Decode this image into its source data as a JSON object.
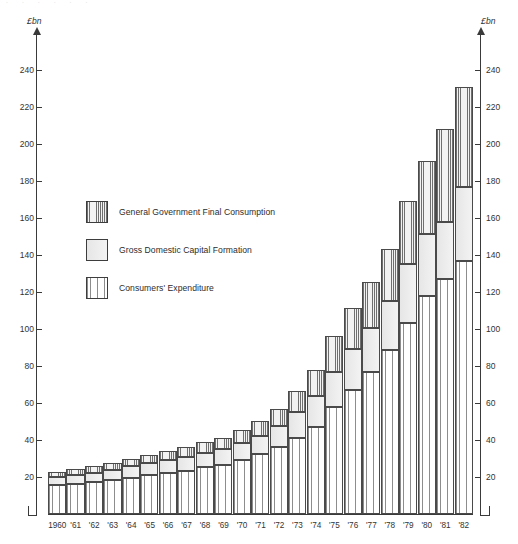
{
  "axes": {
    "unit_label_left": "£bn",
    "unit_label_right": "£bn",
    "y_ticks": [
      20,
      40,
      60,
      80,
      100,
      120,
      140,
      160,
      180,
      200,
      220,
      240
    ],
    "y_min": 0,
    "y_max": 252
  },
  "legend": {
    "items": [
      {
        "key": "government",
        "label": "General Government Final Consumption",
        "pattern": "dense-vertical-hatch"
      },
      {
        "key": "capital",
        "label": "Gross Domestic Capital Formation",
        "pattern": "solid-light-grey"
      },
      {
        "key": "consumers",
        "label": "Consumers' Expenditure",
        "pattern": "sparse-vertical-lines"
      }
    ]
  },
  "chart_data": {
    "type": "bar",
    "title": "",
    "subtitle": "",
    "xlabel": "",
    "ylabel": "£bn",
    "stacked": true,
    "grid": false,
    "legend_position": "inside-upper-left",
    "ylim": [
      0,
      252
    ],
    "yticks": [
      20,
      40,
      60,
      80,
      100,
      120,
      140,
      160,
      180,
      200,
      220,
      240
    ],
    "categories": [
      "1960",
      "'61",
      "'62",
      "'63",
      "'64",
      "'65",
      "'66",
      "'67",
      "'68",
      "'69",
      "'70",
      "'71",
      "'72",
      "'73",
      "'74",
      "'75",
      "'76",
      "'77",
      "'78",
      "'79",
      "'80",
      "'81",
      "'82"
    ],
    "x": [
      1960,
      1961,
      1962,
      1963,
      1964,
      1965,
      1966,
      1967,
      1968,
      1969,
      1970,
      1971,
      1972,
      1973,
      1974,
      1975,
      1976,
      1977,
      1978,
      1979,
      1980,
      1981,
      1982
    ],
    "series": [
      {
        "name": "Consumers' Expenditure",
        "key": "consumers",
        "values": [
          15.5,
          16.3,
          17.3,
          18.5,
          19.7,
          20.9,
          22.3,
          23.4,
          25.2,
          26.7,
          29.0,
          32.3,
          36.4,
          41.1,
          47.3,
          58.1,
          67.2,
          77.0,
          88.6,
          103.5,
          118.0,
          127.0,
          137.0
        ]
      },
      {
        "name": "Gross Domestic Capital Formation",
        "key": "capital",
        "values": [
          4.4,
          4.7,
          4.9,
          5.1,
          6.2,
          6.5,
          6.8,
          7.4,
          8.0,
          8.3,
          9.2,
          10.0,
          11.1,
          14.2,
          16.4,
          18.6,
          22.0,
          23.7,
          26.7,
          31.5,
          33.5,
          31.0,
          40.0
        ]
      },
      {
        "name": "General Government Final Consumption",
        "key": "government",
        "values": [
          3.0,
          3.2,
          3.5,
          3.8,
          4.1,
          4.6,
          5.0,
          5.6,
          6.0,
          6.3,
          7.2,
          8.2,
          9.5,
          11.0,
          14.3,
          19.3,
          22.3,
          24.6,
          28.2,
          34.0,
          39.5,
          50.0,
          54.0
        ]
      }
    ],
    "totals": [
      22.9,
      24.2,
      25.7,
      27.4,
      30.0,
      32.0,
      34.1,
      36.4,
      39.2,
      41.3,
      45.4,
      50.5,
      57.0,
      66.3,
      78.0,
      96.0,
      111.5,
      125.3,
      143.5,
      169.0,
      191.0,
      208.0,
      231.0
    ]
  }
}
